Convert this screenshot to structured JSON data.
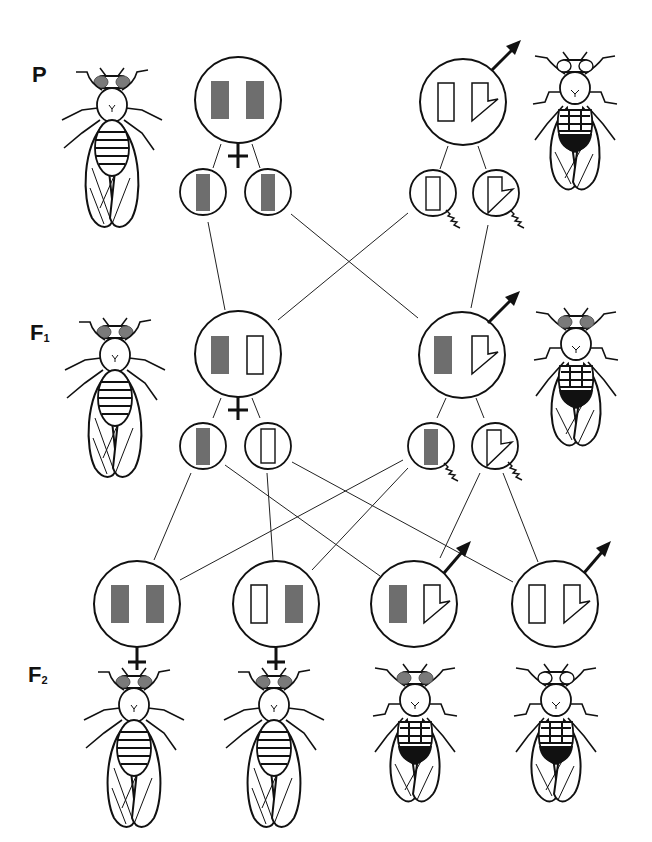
{
  "diagram": {
    "generations": [
      {
        "label": "P",
        "sub": ""
      },
      {
        "label": "F",
        "sub": "1"
      },
      {
        "label": "F",
        "sub": "2"
      }
    ],
    "colors": {
      "line": "#111111",
      "x_chromosome_mutant_fill": "#6e6e6e",
      "eye_red": "#7a7a7a",
      "background": "#ffffff"
    },
    "legend": {
      "filled_bar": "X chromosome carrying dominant (red eye) allele",
      "open_bar": "X chromosome carrying recessive (white eye) allele",
      "hooked_shape": "Y chromosome",
      "female_symbol": "♀",
      "male_symbol": "♂"
    },
    "P": {
      "female": {
        "genotype": [
          "X-filled",
          "X-filled"
        ],
        "phenotype": "red-eyed female"
      },
      "male": {
        "genotype": [
          "X-open",
          "Y"
        ],
        "phenotype": "white-eyed male"
      },
      "female_gametes": [
        "X-filled",
        "X-filled"
      ],
      "male_gametes": [
        "X-open",
        "Y"
      ]
    },
    "F1": {
      "female": {
        "genotype": [
          "X-filled",
          "X-open"
        ],
        "phenotype": "red-eyed female"
      },
      "male": {
        "genotype": [
          "X-filled",
          "Y"
        ],
        "phenotype": "red-eyed male"
      },
      "female_gametes": [
        "X-filled",
        "X-open"
      ],
      "male_gametes": [
        "X-filled",
        "Y"
      ]
    },
    "F2": [
      {
        "sex": "female",
        "genotype": [
          "X-filled",
          "X-filled"
        ],
        "phenotype": "red-eyed female"
      },
      {
        "sex": "female",
        "genotype": [
          "X-open",
          "X-filled"
        ],
        "phenotype": "red-eyed female"
      },
      {
        "sex": "male",
        "genotype": [
          "X-filled",
          "Y"
        ],
        "phenotype": "red-eyed male"
      },
      {
        "sex": "male",
        "genotype": [
          "X-open",
          "Y"
        ],
        "phenotype": "white-eyed male"
      }
    ]
  }
}
